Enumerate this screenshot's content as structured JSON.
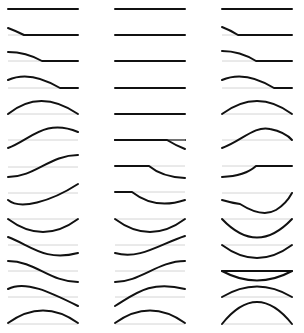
{
  "diagram": {
    "title": "",
    "colors": {
      "curve": "#111111",
      "baseline": "#d4d4d4",
      "background": "#ffffff"
    },
    "layout": {
      "columns_x": [
        [
          8,
          78
        ],
        [
          115,
          185
        ],
        [
          222,
          292
        ]
      ],
      "row_baseline_y": [
        9,
        35,
        61,
        87,
        113,
        139,
        165,
        191,
        217,
        243,
        269,
        295,
        321
      ]
    },
    "columns": [
      {
        "id": "column-1",
        "rows": [
          {
            "shape": "flat"
          },
          {
            "shape": "small-bump-left-then-flat"
          },
          {
            "shape": "larger-bump-left-then-flat"
          },
          {
            "shape": "wide-arch-then-flat"
          },
          {
            "shape": "full-arch"
          },
          {
            "shape": "s-rise-to-arch"
          },
          {
            "shape": "s-rise"
          },
          {
            "shape": "s-rise-from-trough"
          },
          {
            "shape": "full-trough"
          },
          {
            "shape": "s-fall-to-trough"
          },
          {
            "shape": "s-fall"
          },
          {
            "shape": "s-fall-from-arch"
          },
          {
            "shape": "full-arch"
          }
        ]
      },
      {
        "id": "column-2",
        "rows": [
          {
            "shape": "flat"
          },
          {
            "shape": "flat"
          },
          {
            "shape": "flat"
          },
          {
            "shape": "flat"
          },
          {
            "shape": "flat"
          },
          {
            "shape": "flat"
          },
          {
            "shape": "flat-then-small-dip-right"
          },
          {
            "shape": "flat-then-larger-dip-right"
          },
          {
            "shape": "short-flat-then-trough"
          },
          {
            "shape": "full-trough"
          },
          {
            "shape": "s-rise-from-trough"
          },
          {
            "shape": "s-rise"
          },
          {
            "shape": "full-arch"
          }
        ]
      },
      {
        "id": "column-3",
        "rows": [
          {
            "shape": "flat"
          },
          {
            "shape": "small-bump-left-then-flat"
          },
          {
            "shape": "larger-bump-left-then-flat"
          },
          {
            "shape": "wide-arch-then-flat"
          },
          {
            "shape": "full-arch"
          },
          {
            "shape": "s-rise-to-arch"
          },
          {
            "shape": "rise-then-flat"
          },
          {
            "shape": "kinked-trough"
          },
          {
            "shape": "deep-trough"
          },
          {
            "shape": "deep-trough"
          },
          {
            "shape": "shallow-trough"
          },
          {
            "shape": "flat"
          },
          {
            "shape": "arch"
          },
          {
            "shape": "tall-arch"
          }
        ]
      }
    ]
  }
}
